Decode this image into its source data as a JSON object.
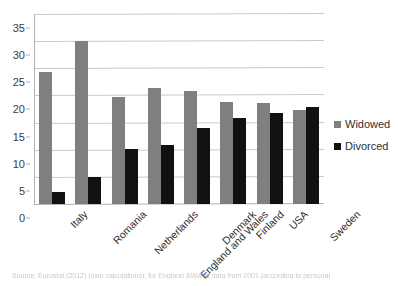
{
  "chart_data": {
    "type": "bar",
    "title": "",
    "xlabel": "",
    "ylabel": "",
    "ylim": [
      0,
      35
    ],
    "yticks": [
      0,
      5,
      10,
      15,
      20,
      25,
      30,
      35
    ],
    "grid": true,
    "legend_position": "right",
    "categories": [
      "Italy",
      "Romania",
      "Netherlands",
      "England and Wales",
      "Denmark",
      "Finland",
      "USA",
      "Sweden"
    ],
    "series": [
      {
        "name": "Widowed",
        "color": "#7f7f7f",
        "values": [
          24.3,
          30.1,
          19.8,
          21.3,
          20.9,
          18.8,
          18.7,
          17.3
        ]
      },
      {
        "name": "Divorced",
        "color": "#111111",
        "values": [
          2.2,
          5.0,
          10.1,
          10.8,
          14.0,
          15.8,
          16.7,
          17.8
        ]
      }
    ]
  },
  "legend": {
    "items": [
      {
        "label": "Widowed",
        "swatch": "widowed"
      },
      {
        "label": "Divorced",
        "swatch": "divorced"
      }
    ]
  },
  "caption": {
    "text": "Source: Eurostat (2012) (own calculations); for England &Wales data from 2001 (according to personal"
  }
}
